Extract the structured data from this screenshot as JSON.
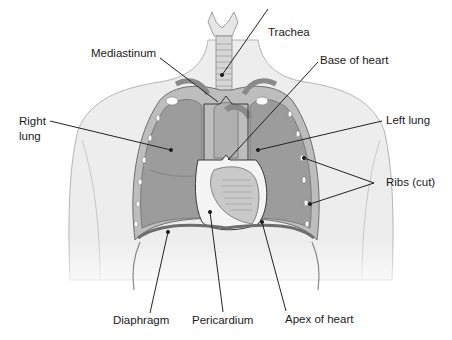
{
  "figure": {
    "colors": {
      "skin": "#ededed",
      "skin_outline": "#b5b5b5",
      "lung": "#9c9c9c",
      "lung_dark": "#8a8a8a",
      "cavity_wall": "#bdbdbd",
      "heart": "#c9c9c9",
      "pericardium": "#f4f4f4",
      "rib": "#ffffff",
      "leader": "#222222",
      "text": "#1a1a1a"
    },
    "labels": {
      "trachea": "Trachea",
      "mediastinum": "Mediastinum",
      "base_of_heart": "Base of heart",
      "right_lung_1": "Right",
      "right_lung_2": "lung",
      "left_lung": "Left lung",
      "ribs_cut": "Ribs (cut)",
      "diaphragm": "Diaphragm",
      "pericardium": "Pericardium",
      "apex_of_heart": "Apex of heart"
    }
  }
}
